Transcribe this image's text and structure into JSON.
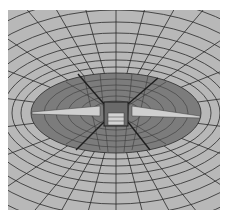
{
  "figure": {
    "colors": {
      "background": "#ffffff",
      "outer_mesh": "#b8b8b8",
      "inner_region": "#7c7c7c",
      "mesh_lines": "#2a2a2a",
      "highlight": "#d0d0d0"
    }
  }
}
